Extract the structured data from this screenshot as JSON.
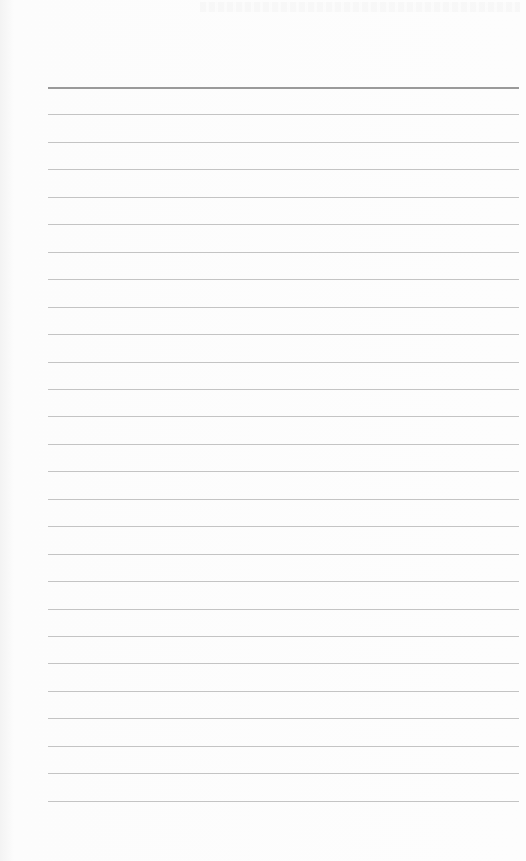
{
  "document": {
    "type": "lined-paper",
    "background_color": "#fdfdfd",
    "rule_color": "#c4c4c4",
    "header_rule_color": "#9a9a9a",
    "rule_count": 27,
    "first_rule_y": 87,
    "rule_spacing": 27.45,
    "rule_left": 48,
    "rule_right": 519
  }
}
